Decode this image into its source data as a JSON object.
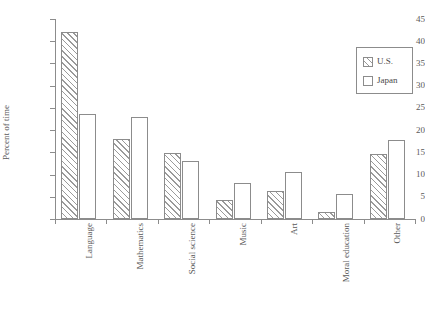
{
  "chart_data": {
    "type": "bar",
    "title": "",
    "xlabel": "",
    "ylabel": "Percent of time",
    "ylim": [
      0,
      45
    ],
    "yticks": [
      0,
      5,
      10,
      15,
      20,
      25,
      30,
      35,
      40,
      45
    ],
    "grid": false,
    "legend_position": "top-right",
    "categories": [
      "Language",
      "Mathematics",
      "Social science",
      "Music",
      "Art",
      "Moral education",
      "Other"
    ],
    "series": [
      {
        "name": "U.S.",
        "values": [
          42.0,
          18.0,
          14.8,
          4.2,
          6.3,
          1.5,
          14.6
        ],
        "fill": "hatched",
        "color": "#9a9a9a"
      },
      {
        "name": "Japan",
        "values": [
          23.7,
          23.0,
          13.0,
          8.0,
          10.5,
          5.7,
          17.8
        ],
        "fill": "empty",
        "color": "#ffffff"
      }
    ]
  },
  "legend": {
    "items": [
      {
        "label": "U.S."
      },
      {
        "label": "Japan"
      }
    ]
  },
  "axis": {
    "y_label": "Percent of time",
    "y_tick_labels": [
      "0",
      "5",
      "10",
      "15",
      "20",
      "25",
      "30",
      "35",
      "40",
      "45"
    ],
    "x_tick_labels": [
      "Language",
      "Mathematics",
      "Social science",
      "Music",
      "Art",
      "Moral education",
      "Other"
    ]
  },
  "colors": {
    "axis": "#8c8c8c",
    "text": "#4a4a4a",
    "hatch": "#9a9a9a",
    "background": "#ffffff"
  }
}
